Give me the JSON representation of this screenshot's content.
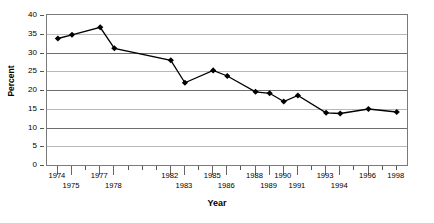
{
  "chart_data": {
    "type": "line",
    "title": "",
    "xlabel": "Year",
    "ylabel": "Percent",
    "ylim": [
      0,
      40
    ],
    "ytick_step": 5,
    "yticks": [
      "0",
      "5",
      "10",
      "15",
      "20",
      "25",
      "30",
      "35",
      "40"
    ],
    "grid": true,
    "grid_axis": "y",
    "legend": "none",
    "x": [
      1974,
      1975,
      1977,
      1978,
      1982,
      1983,
      1985,
      1986,
      1988,
      1989,
      1990,
      1991,
      1993,
      1994,
      1996,
      1998
    ],
    "categories": [
      "1974",
      "1975",
      "1977",
      "1978",
      "1982",
      "1983",
      "1985",
      "1986",
      "1988",
      "1989",
      "1990",
      "1991",
      "1993",
      "1994",
      "1996",
      "1998"
    ],
    "values": [
      34.0,
      35.0,
      37.0,
      31.4,
      28.2,
      22.2,
      25.5,
      24.0,
      19.8,
      19.4,
      17.2,
      18.8,
      14.2,
      14.0,
      15.2,
      14.4
    ],
    "series": [
      {
        "name": "Percent",
        "marker": "diamond",
        "color": "#000000",
        "values": [
          34.0,
          35.0,
          37.0,
          31.4,
          28.2,
          22.2,
          25.5,
          24.0,
          19.8,
          19.4,
          17.2,
          18.8,
          14.2,
          14.0,
          15.2,
          14.4
        ]
      }
    ],
    "xaxis_tick_years": [
      1974,
      1975,
      1976,
      1977,
      1978,
      1979,
      1980,
      1981,
      1982,
      1983,
      1984,
      1985,
      1986,
      1987,
      1988,
      1989,
      1990,
      1991,
      1992,
      1993,
      1994,
      1995,
      1996,
      1997,
      1998
    ],
    "xaxis_labels": [
      {
        "year": 1974,
        "text": "1974",
        "row": 0
      },
      {
        "year": 1975,
        "text": "1975",
        "row": 1
      },
      {
        "year": 1977,
        "text": "1977",
        "row": 0
      },
      {
        "year": 1978,
        "text": "1978",
        "row": 1
      },
      {
        "year": 1982,
        "text": "1982",
        "row": 0
      },
      {
        "year": 1983,
        "text": "1983",
        "row": 1
      },
      {
        "year": 1985,
        "text": "1985",
        "row": 0
      },
      {
        "year": 1986,
        "text": "1986",
        "row": 1
      },
      {
        "year": 1988,
        "text": "1988",
        "row": 0
      },
      {
        "year": 1989,
        "text": "1989",
        "row": 1
      },
      {
        "year": 1990,
        "text": "1990",
        "row": 0
      },
      {
        "year": 1991,
        "text": "1991",
        "row": 1
      },
      {
        "year": 1993,
        "text": "1993",
        "row": 0
      },
      {
        "year": 1994,
        "text": "1994",
        "row": 1
      },
      {
        "year": 1996,
        "text": "1996",
        "row": 0
      },
      {
        "year": 1998,
        "text": "1998",
        "row": 0
      }
    ],
    "xlim": [
      1973.3,
      1998.8
    ],
    "colors": {
      "line": "#000000",
      "marker": "#000000",
      "gridline_light": "#b8b8b8",
      "gridline_dark": "#6e6e6e",
      "frame": "#7a7a7a",
      "text": "#000000"
    }
  },
  "top_remnant": "____   _  _  _"
}
